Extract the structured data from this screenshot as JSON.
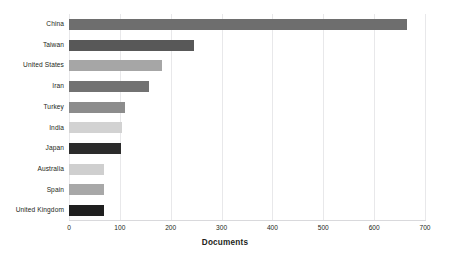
{
  "chart_data": {
    "type": "bar",
    "orientation": "horizontal",
    "title": "",
    "subtitle": "",
    "xlabel": "Documents",
    "ylabel": "",
    "xlim": [
      0,
      700
    ],
    "xticks": [
      0,
      100,
      200,
      300,
      400,
      500,
      600,
      700
    ],
    "xtick_labels": [
      "0",
      "100",
      "200",
      "300",
      "400",
      "500",
      "600",
      "700"
    ],
    "grid": "vertical",
    "legend": "none",
    "categories": [
      "China",
      "Taiwan",
      "United States",
      "Iran",
      "Turkey",
      "India",
      "Japan",
      "Australia",
      "Spain",
      "United Kingdom"
    ],
    "values": [
      665,
      246,
      183,
      157,
      110,
      104,
      102,
      69,
      69,
      69
    ],
    "bar_colors": [
      "#6e6e6e",
      "#585858",
      "#a6a6a6",
      "#727272",
      "#8c8c8c",
      "#d2d2d2",
      "#2b2b2b",
      "#cfcfcf",
      "#a8a8a8",
      "#1f1f1f"
    ]
  },
  "axis": {
    "grid_color": "#e8e8ea",
    "baseline_color": "#d9d9dc",
    "text_color": "#231f20"
  },
  "canvas": {
    "background": "#ffffff"
  }
}
